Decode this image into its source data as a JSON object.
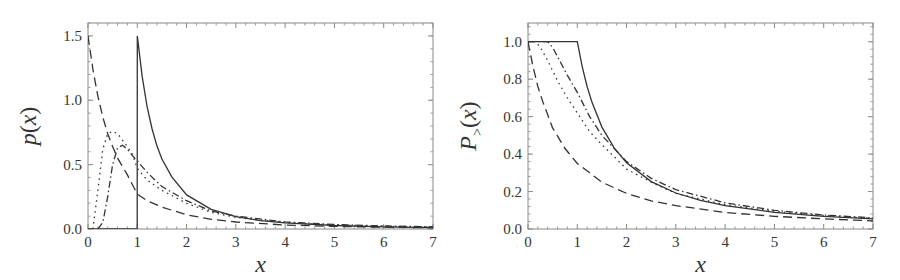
{
  "chart_data": [
    {
      "type": "line",
      "title": "",
      "xlabel": "x",
      "ylabel": "p(x)",
      "xlim": [
        0,
        7
      ],
      "ylim": [
        0,
        1.6
      ],
      "xticks": [
        "0",
        "1",
        "2",
        "3",
        "4",
        "5",
        "6",
        "7"
      ],
      "yticks": [
        "0.0",
        "0.5",
        "1.0",
        "1.5"
      ],
      "ytick_values": [
        0,
        0.5,
        1.0,
        1.5
      ],
      "grid": false,
      "legend": null,
      "series": [
        {
          "name": "solid",
          "style": "solid",
          "x": [
            0,
            0.999,
            1,
            1.1,
            1.2,
            1.3,
            1.4,
            1.5,
            1.7,
            2,
            2.5,
            3,
            3.5,
            4,
            5,
            6,
            7
          ],
          "y": [
            0,
            0,
            1.5,
            1.183,
            0.951,
            0.777,
            0.644,
            0.544,
            0.405,
            0.265,
            0.152,
            0.096,
            0.065,
            0.047,
            0.027,
            0.017,
            0.011
          ]
        },
        {
          "name": "dash-dot",
          "style": "dashdot",
          "x": [
            0.2,
            0.3,
            0.4,
            0.5,
            0.6,
            0.7,
            0.8,
            0.9,
            1,
            1.2,
            1.5,
            2,
            2.5,
            3,
            4,
            5,
            6,
            7
          ],
          "y": [
            0,
            0.05,
            0.25,
            0.5,
            0.63,
            0.65,
            0.62,
            0.57,
            0.53,
            0.44,
            0.33,
            0.22,
            0.14,
            0.1,
            0.055,
            0.035,
            0.024,
            0.017
          ]
        },
        {
          "name": "dotted",
          "style": "dotted",
          "x": [
            0.1,
            0.2,
            0.3,
            0.4,
            0.5,
            0.6,
            0.7,
            0.8,
            0.9,
            1,
            1.2,
            1.5,
            2,
            2.5,
            3,
            4,
            5,
            6,
            7
          ],
          "y": [
            0,
            0.3,
            0.62,
            0.74,
            0.76,
            0.74,
            0.69,
            0.64,
            0.58,
            0.47,
            0.38,
            0.3,
            0.2,
            0.13,
            0.09,
            0.05,
            0.032,
            0.022,
            0.016
          ]
        },
        {
          "name": "dashed",
          "style": "dashed",
          "x": [
            0,
            0.1,
            0.2,
            0.3,
            0.4,
            0.5,
            0.6,
            0.8,
            1,
            1.2,
            1.5,
            2,
            2.5,
            3,
            4,
            5,
            6,
            7
          ],
          "y": [
            1.5,
            1.24,
            1.03,
            0.87,
            0.74,
            0.64,
            0.55,
            0.42,
            0.27,
            0.22,
            0.17,
            0.11,
            0.075,
            0.054,
            0.031,
            0.02,
            0.014,
            0.01
          ]
        }
      ]
    },
    {
      "type": "line",
      "title": "",
      "xlabel": "x",
      "ylabel": "P>(x)",
      "xlim": [
        0,
        7
      ],
      "ylim": [
        0,
        1.1
      ],
      "xticks": [
        "0",
        "1",
        "2",
        "3",
        "4",
        "5",
        "6",
        "7"
      ],
      "yticks": [
        "0.0",
        "0.2",
        "0.4",
        "0.6",
        "0.8",
        "1.0"
      ],
      "ytick_values": [
        0,
        0.2,
        0.4,
        0.6,
        0.8,
        1.0
      ],
      "grid": false,
      "legend": null,
      "series": [
        {
          "name": "solid",
          "style": "solid",
          "x": [
            0,
            1,
            1.1,
            1.2,
            1.3,
            1.5,
            1.75,
            2,
            2.5,
            3,
            3.5,
            4,
            5,
            6,
            7
          ],
          "y": [
            1,
            1,
            0.867,
            0.761,
            0.675,
            0.544,
            0.432,
            0.354,
            0.253,
            0.192,
            0.153,
            0.125,
            0.089,
            0.068,
            0.054
          ]
        },
        {
          "name": "dash-dot",
          "style": "dashdot",
          "x": [
            0,
            0.4,
            0.5,
            0.6,
            0.8,
            1,
            1.25,
            1.5,
            2,
            2.5,
            3,
            4,
            5,
            6,
            7
          ],
          "y": [
            1,
            1,
            0.97,
            0.92,
            0.82,
            0.73,
            0.6,
            0.5,
            0.36,
            0.27,
            0.21,
            0.14,
            0.1,
            0.075,
            0.06
          ]
        },
        {
          "name": "dotted",
          "style": "dotted",
          "x": [
            0,
            0.15,
            0.25,
            0.4,
            0.6,
            0.8,
            1,
            1.25,
            1.5,
            2,
            2.5,
            3,
            4,
            5,
            6,
            7
          ],
          "y": [
            1,
            1,
            0.97,
            0.9,
            0.79,
            0.7,
            0.62,
            0.52,
            0.45,
            0.32,
            0.25,
            0.19,
            0.13,
            0.095,
            0.072,
            0.057
          ]
        },
        {
          "name": "dashed",
          "style": "dashed",
          "x": [
            0,
            0.1,
            0.2,
            0.3,
            0.5,
            0.75,
            1,
            1.25,
            1.5,
            2,
            2.5,
            3,
            4,
            5,
            6,
            7
          ],
          "y": [
            1,
            0.87,
            0.76,
            0.68,
            0.54,
            0.43,
            0.35,
            0.3,
            0.25,
            0.19,
            0.15,
            0.125,
            0.088,
            0.068,
            0.054,
            0.044
          ]
        }
      ]
    }
  ],
  "panels": [
    {
      "ylabel_main": "p",
      "ylabel_sub": "",
      "xlabel": "x"
    },
    {
      "ylabel_main": "P",
      "ylabel_sub": ">",
      "xlabel": "x"
    }
  ]
}
